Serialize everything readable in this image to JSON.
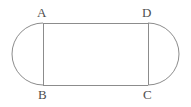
{
  "figure": {
    "shape_type": "stadium",
    "stroke_color": "#8c8c8c",
    "background_color": "#ffffff",
    "stroke_width": 1,
    "labels": {
      "top_left": "A",
      "top_right": "D",
      "bottom_left": "B",
      "bottom_right": "C"
    },
    "geometry": {
      "rect_left_x": 43,
      "rect_right_x": 148,
      "rect_top_y": 23,
      "rect_bottom_y": 85,
      "left_arc_extent_x": 13,
      "right_arc_extent_x": 178,
      "arc_radius": 31,
      "rect_width": 105,
      "rect_height": 62
    }
  }
}
